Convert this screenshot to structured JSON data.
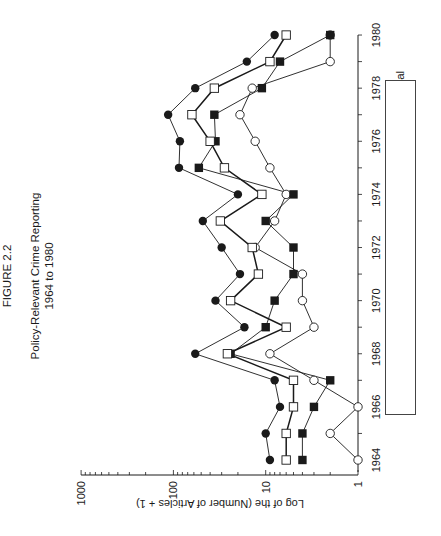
{
  "figure": {
    "label": "FIGURE 2.2",
    "title": "Policy-Relevant Crime Reporting",
    "subtitle": "1964 to 1980"
  },
  "chart_data": {
    "type": "line",
    "orientation": "rotated 90 degrees clockwise (years run bottom-to-top on right, value axis along bottom)",
    "xlabel": "",
    "ylabel": "Log of the (Number of Articles + 1)",
    "yscale": "log",
    "ylim": [
      1,
      1000
    ],
    "y_ticks": [
      "1",
      "10",
      "100",
      "1000"
    ],
    "x_ticks": [
      "1964",
      "1966",
      "1968",
      "1970",
      "1972",
      "1974",
      "1976",
      "1978",
      "1980"
    ],
    "x": [
      1964,
      1965,
      1966,
      1967,
      1968,
      1969,
      1970,
      1971,
      1972,
      1973,
      1974,
      1975,
      1976,
      1977,
      1978,
      1979,
      1980
    ],
    "series": [
      {
        "name": "Total",
        "marker": "filled-circle",
        "values": [
          9,
          10,
          7,
          8,
          58,
          17,
          35,
          19,
          30,
          48,
          20,
          87,
          85,
          114,
          58,
          16,
          8
        ]
      },
      {
        "name": "Supportive",
        "marker": "open-circle",
        "values": [
          1,
          2,
          1,
          3,
          9,
          3,
          4,
          4,
          13,
          8,
          6,
          9,
          13,
          19,
          14,
          2,
          2
        ]
      },
      {
        "name": "Neutral",
        "marker": "filled-square",
        "values": [
          4,
          4,
          3,
          2,
          24,
          10,
          8,
          5,
          5,
          10,
          5,
          53,
          35,
          36,
          11,
          7,
          2
        ]
      },
      {
        "name": "Critical",
        "marker": "open-square",
        "values": [
          6,
          6,
          5,
          5,
          26,
          6,
          24,
          12,
          14,
          31,
          11,
          28,
          40,
          63,
          36,
          9,
          6
        ]
      }
    ],
    "legend": [
      "Total",
      "Supportive",
      "Neutral",
      "Critical"
    ],
    "legend_position": "right (rotated, below plot in reading orientation)",
    "grid": false
  },
  "colors": {
    "ink": "#1a1a1a",
    "background": "#ffffff"
  }
}
